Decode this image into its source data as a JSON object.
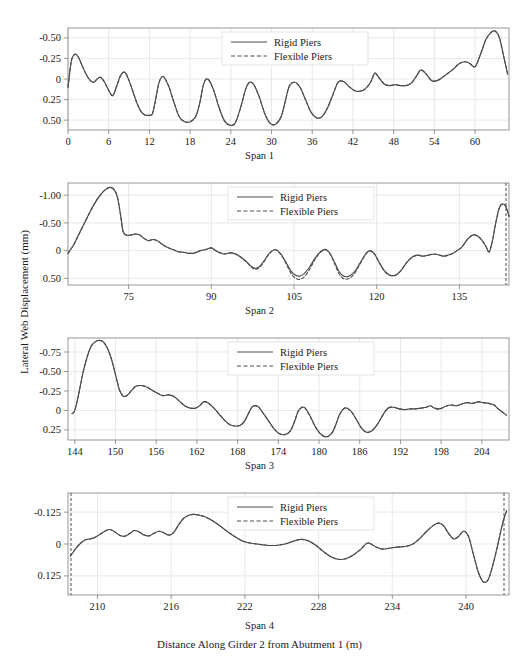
{
  "figure": {
    "top_caption": "",
    "ylabel": "Lateral Web Displacement (mm)",
    "xlabel": "Distance Along Girder 2 from Abutment 1 (m)",
    "legend": {
      "rigid_label": "Rigid Piers",
      "flexible_label": "Flexible Piers"
    },
    "colors": {
      "line": "#4d4d4d",
      "axis": "#7d7d7d",
      "grid": "#d9d9e0",
      "text": "#1a1a1a"
    }
  },
  "chart_data": [
    {
      "type": "line",
      "title": "Span 1",
      "xlabel": "",
      "ylabel": "Lateral Web Displacement (mm)",
      "xlim": [
        0,
        65
      ],
      "ylim": [
        0.62,
        -0.62
      ],
      "y_inverted": true,
      "grid": true,
      "legend_position": "top-center",
      "xticks": [
        0,
        6,
        12,
        18,
        24,
        30,
        36,
        42,
        48,
        54,
        60
      ],
      "yticks": [
        -0.5,
        -0.25,
        0,
        0.25,
        0.5
      ],
      "ytick_labels": [
        "-0.50",
        "-0.25",
        "0",
        "0.25",
        "0.50"
      ],
      "series": [
        {
          "name": "Rigid Piers",
          "style": "solid",
          "x": [
            0.0,
            0.5,
            1.0,
            1.5,
            2.0,
            2.6,
            3.2,
            3.8,
            4.3,
            4.8,
            5.4,
            6.0,
            6.6,
            7.2,
            7.8,
            8.4,
            9.0,
            9.6,
            10.2,
            10.8,
            11.4,
            12.0,
            12.4,
            12.8,
            13.4,
            14.0,
            14.8,
            15.6,
            16.4,
            17.2,
            18.0,
            18.8,
            19.4,
            20.0,
            20.6,
            21.4,
            22.2,
            23.0,
            23.8,
            24.6,
            25.4,
            26.2,
            26.8,
            27.4,
            28.2,
            29.0,
            29.8,
            30.6,
            31.4,
            32.0,
            32.6,
            33.4,
            34.2,
            35.0,
            35.8,
            36.6,
            37.4,
            38.2,
            39.0,
            39.8,
            40.6,
            41.4,
            42.2,
            43.0,
            43.8,
            44.6,
            45.2,
            45.8,
            46.6,
            47.4,
            48.2,
            49.0,
            49.8,
            50.6,
            51.4,
            52.0,
            52.8,
            53.6,
            54.4,
            55.2,
            56.0,
            56.8,
            57.4,
            58.0,
            58.6,
            59.2,
            60.0,
            60.8,
            61.6,
            62.4,
            63.0,
            63.6,
            64.2,
            64.8
          ],
          "y": [
            0.1,
            -0.22,
            -0.3,
            -0.27,
            -0.18,
            -0.07,
            0.01,
            0.04,
            0.0,
            -0.02,
            0.04,
            0.14,
            0.2,
            0.08,
            -0.05,
            -0.08,
            0.02,
            0.16,
            0.3,
            0.4,
            0.44,
            0.44,
            0.43,
            0.3,
            0.05,
            -0.03,
            0.08,
            0.28,
            0.46,
            0.52,
            0.52,
            0.46,
            0.3,
            0.06,
            0.0,
            0.12,
            0.33,
            0.5,
            0.56,
            0.54,
            0.36,
            0.12,
            0.04,
            0.07,
            0.22,
            0.42,
            0.54,
            0.55,
            0.46,
            0.28,
            0.09,
            0.04,
            0.1,
            0.25,
            0.4,
            0.47,
            0.46,
            0.36,
            0.2,
            0.04,
            0.03,
            0.09,
            0.14,
            0.15,
            0.12,
            0.04,
            -0.07,
            -0.02,
            0.06,
            0.08,
            0.07,
            0.08,
            0.08,
            0.05,
            -0.04,
            -0.11,
            -0.06,
            0.02,
            0.02,
            -0.02,
            -0.07,
            -0.12,
            -0.17,
            -0.2,
            -0.21,
            -0.19,
            -0.15,
            -0.3,
            -0.48,
            -0.57,
            -0.58,
            -0.5,
            -0.28,
            -0.06
          ]
        },
        {
          "name": "Flexible Piers",
          "style": "dashed",
          "note": "Virtually coincident with Rigid Piers across Span 1"
        }
      ]
    },
    {
      "type": "line",
      "title": "Span 2",
      "xlabel": "",
      "ylabel": "Lateral Web Displacement (mm)",
      "xlim": [
        64,
        144
      ],
      "ylim": [
        0.62,
        -1.22
      ],
      "y_inverted": true,
      "grid": true,
      "legend_position": "top-center",
      "xticks": [
        75,
        90,
        105,
        120,
        135
      ],
      "yticks": [
        -1.0,
        -0.5,
        0,
        0.5
      ],
      "ytick_labels": [
        "-1.00",
        "-0.50",
        "0",
        "0.50"
      ],
      "series": [
        {
          "name": "Rigid Piers",
          "style": "solid",
          "x": [
            64.0,
            65.0,
            66.0,
            67.0,
            68.0,
            69.0,
            70.0,
            70.8,
            71.5,
            72.0,
            72.5,
            73.0,
            73.6,
            74.0,
            74.6,
            75.4,
            76.2,
            77.0,
            77.8,
            78.6,
            79.4,
            80.2,
            81.0,
            82.0,
            83.0,
            84.0,
            85.0,
            86.0,
            87.0,
            88.0,
            89.0,
            90.0,
            90.8,
            91.6,
            92.4,
            93.4,
            94.4,
            95.4,
            96.4,
            97.2,
            98.0,
            98.8,
            99.6,
            100.6,
            101.6,
            102.6,
            103.6,
            104.4,
            105.2,
            106.0,
            106.8,
            107.8,
            108.8,
            109.8,
            110.8,
            111.6,
            112.4,
            113.2,
            114.0,
            115.0,
            116.0,
            117.0,
            118.0,
            118.8,
            119.6,
            120.4,
            121.4,
            122.4,
            123.4,
            124.4,
            125.4,
            126.4,
            127.4,
            128.4,
            129.4,
            130.4,
            131.4,
            132.2,
            133.0,
            133.8,
            134.6,
            135.4,
            136.0,
            136.6,
            137.4,
            138.2,
            139.0,
            139.8,
            140.4,
            141.0,
            141.6,
            142.2,
            142.8,
            143.4,
            144.0
          ],
          "y": [
            0.05,
            -0.1,
            -0.3,
            -0.5,
            -0.7,
            -0.88,
            -1.02,
            -1.1,
            -1.14,
            -1.13,
            -1.08,
            -0.95,
            -0.6,
            -0.34,
            -0.28,
            -0.28,
            -0.3,
            -0.28,
            -0.22,
            -0.18,
            -0.2,
            -0.18,
            -0.12,
            -0.06,
            -0.02,
            0.02,
            0.03,
            0.05,
            0.04,
            0.0,
            -0.02,
            -0.05,
            0.0,
            0.04,
            0.06,
            0.04,
            0.06,
            0.12,
            0.2,
            0.28,
            0.32,
            0.28,
            0.18,
            0.04,
            -0.02,
            0.06,
            0.22,
            0.36,
            0.44,
            0.46,
            0.42,
            0.3,
            0.14,
            0.02,
            -0.02,
            0.06,
            0.22,
            0.38,
            0.46,
            0.46,
            0.38,
            0.22,
            0.06,
            0.0,
            0.06,
            0.2,
            0.36,
            0.44,
            0.44,
            0.36,
            0.22,
            0.12,
            0.08,
            0.1,
            0.08,
            0.06,
            0.08,
            0.1,
            0.08,
            0.05,
            0.0,
            -0.06,
            -0.14,
            -0.22,
            -0.28,
            -0.27,
            -0.2,
            -0.08,
            0.02,
            -0.18,
            -0.5,
            -0.76,
            -0.84,
            -0.8,
            -0.62
          ]
        },
        {
          "name": "Flexible Piers",
          "style": "dashed",
          "note": "Offset slightly positive (down) of Rigid Piers between 92 and 125 m; converges elsewhere",
          "offset_region": [
            92,
            125
          ],
          "max_offset": 0.07
        }
      ]
    },
    {
      "type": "line",
      "title": "Span 3",
      "xlabel": "",
      "ylabel": "Lateral Web Displacement (mm)",
      "xlim": [
        143,
        208
      ],
      "ylim": [
        0.38,
        -0.93
      ],
      "y_inverted": true,
      "grid": true,
      "legend_position": "top-center",
      "xticks": [
        144,
        150,
        156,
        162,
        168,
        174,
        180,
        186,
        192,
        198,
        204
      ],
      "yticks": [
        -0.75,
        -0.5,
        -0.25,
        0,
        0.25
      ],
      "ytick_labels": [
        "-0.75",
        "-0.50",
        "-0.25",
        "0",
        "0.25"
      ],
      "series": [
        {
          "name": "Rigid Piers",
          "style": "solid",
          "x": [
            143.6,
            144.0,
            144.6,
            145.2,
            145.8,
            146.4,
            147.0,
            147.6,
            148.2,
            148.8,
            149.4,
            150.0,
            150.6,
            151.2,
            151.8,
            152.4,
            153.0,
            153.8,
            154.6,
            155.4,
            156.2,
            157.0,
            157.8,
            158.6,
            159.4,
            160.2,
            161.0,
            161.8,
            162.4,
            163.0,
            163.6,
            164.4,
            165.2,
            166.0,
            166.8,
            167.6,
            168.4,
            169.0,
            169.6,
            170.2,
            171.0,
            171.8,
            172.6,
            173.4,
            174.2,
            175.0,
            175.8,
            176.4,
            177.0,
            177.8,
            178.6,
            179.4,
            180.2,
            181.0,
            181.8,
            182.4,
            183.0,
            183.8,
            184.6,
            185.4,
            186.2,
            187.0,
            187.8,
            188.6,
            189.4,
            190.2,
            191.0,
            191.8,
            192.6,
            193.4,
            194.2,
            195.0,
            195.8,
            196.4,
            197.0,
            197.8,
            198.6,
            199.4,
            200.2,
            201.0,
            201.8,
            202.6,
            203.4,
            204.2,
            205.0,
            205.8,
            206.4,
            207.0,
            207.6
          ],
          "y": [
            0.04,
            0.0,
            -0.22,
            -0.48,
            -0.68,
            -0.82,
            -0.88,
            -0.9,
            -0.88,
            -0.8,
            -0.66,
            -0.46,
            -0.26,
            -0.18,
            -0.2,
            -0.26,
            -0.31,
            -0.32,
            -0.3,
            -0.26,
            -0.22,
            -0.19,
            -0.2,
            -0.18,
            -0.12,
            -0.06,
            -0.03,
            -0.03,
            -0.06,
            -0.11,
            -0.1,
            -0.04,
            0.04,
            0.12,
            0.18,
            0.2,
            0.19,
            0.14,
            0.04,
            -0.05,
            -0.05,
            0.04,
            0.14,
            0.24,
            0.3,
            0.31,
            0.26,
            0.14,
            0.0,
            -0.04,
            0.06,
            0.2,
            0.3,
            0.34,
            0.3,
            0.2,
            0.06,
            -0.03,
            0.0,
            0.1,
            0.22,
            0.28,
            0.26,
            0.18,
            0.06,
            -0.03,
            -0.04,
            -0.02,
            -0.01,
            -0.02,
            -0.02,
            -0.03,
            -0.04,
            -0.06,
            -0.03,
            -0.02,
            -0.05,
            -0.07,
            -0.06,
            -0.08,
            -0.1,
            -0.09,
            -0.11,
            -0.1,
            -0.09,
            -0.07,
            -0.02,
            0.02,
            0.06
          ]
        },
        {
          "name": "Flexible Piers",
          "style": "dashed",
          "note": "Essentially coincident with Rigid Piers across Span 3"
        }
      ]
    },
    {
      "type": "line",
      "title": "Span 4",
      "xlabel": "Distance Along Girder 2 from Abutment 1 (m)",
      "ylabel": "Lateral Web Displacement (mm)",
      "xlim": [
        207.6,
        243.5
      ],
      "ylim": [
        0.2,
        -0.2
      ],
      "y_inverted": true,
      "grid": true,
      "legend_position": "top-center",
      "xticks": [
        210,
        216,
        222,
        228,
        234,
        240
      ],
      "yticks": [
        -0.125,
        0,
        0.125
      ],
      "ytick_labels": [
        "-0.125",
        "0",
        "0.125"
      ],
      "series": [
        {
          "name": "Rigid Piers",
          "style": "solid",
          "x": [
            207.8,
            208.2,
            208.6,
            209.0,
            209.4,
            209.8,
            210.2,
            210.6,
            211.0,
            211.4,
            211.8,
            212.2,
            212.6,
            213.0,
            213.4,
            213.8,
            214.2,
            214.6,
            215.0,
            215.4,
            215.8,
            216.2,
            216.6,
            217.0,
            217.4,
            217.8,
            218.2,
            218.8,
            219.4,
            220.0,
            220.6,
            221.2,
            221.8,
            222.4,
            223.0,
            223.6,
            224.2,
            224.8,
            225.4,
            226.0,
            226.6,
            227.2,
            227.8,
            228.4,
            229.0,
            229.6,
            230.2,
            230.8,
            231.4,
            232.0,
            232.6,
            233.2,
            233.8,
            234.4,
            235.0,
            235.6,
            236.2,
            236.8,
            237.4,
            237.8,
            238.2,
            238.6,
            239.0,
            239.4,
            239.8,
            240.2,
            240.6,
            241.0,
            241.4,
            241.8,
            242.2,
            242.6,
            243.0,
            243.3
          ],
          "y": [
            0.047,
            0.02,
            -0.002,
            -0.016,
            -0.02,
            -0.026,
            -0.038,
            -0.05,
            -0.057,
            -0.048,
            -0.034,
            -0.03,
            -0.04,
            -0.053,
            -0.047,
            -0.035,
            -0.032,
            -0.042,
            -0.05,
            -0.044,
            -0.035,
            -0.045,
            -0.075,
            -0.1,
            -0.112,
            -0.116,
            -0.114,
            -0.106,
            -0.09,
            -0.07,
            -0.048,
            -0.028,
            -0.012,
            -0.004,
            0.0,
            0.004,
            0.006,
            0.004,
            -0.002,
            -0.012,
            -0.018,
            -0.012,
            0.006,
            0.03,
            0.05,
            0.06,
            0.058,
            0.044,
            0.022,
            -0.004,
            0.01,
            0.02,
            0.016,
            0.012,
            0.01,
            0.002,
            -0.02,
            -0.05,
            -0.075,
            -0.082,
            -0.07,
            -0.04,
            -0.02,
            -0.03,
            -0.05,
            -0.03,
            0.04,
            0.11,
            0.148,
            0.14,
            0.08,
            0.0,
            -0.085,
            -0.13
          ]
        },
        {
          "name": "Flexible Piers",
          "style": "dashed",
          "note": "Coincident with Rigid Piers; vertical dashed boundary markers at both span ends"
        }
      ]
    }
  ]
}
